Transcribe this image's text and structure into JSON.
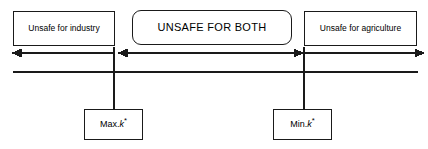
{
  "diagram": {
    "colors": {
      "stroke": "#1a1a1a",
      "background": "#ffffff",
      "text": "#000000"
    },
    "zones": [
      {
        "id": "industry",
        "label": "Unsafe for industry",
        "arrow_direction": "left",
        "shape": "rectangle"
      },
      {
        "id": "both",
        "label": "UNSAFE FOR BOTH",
        "arrow_direction": "both",
        "shape": "rounded-rectangle"
      },
      {
        "id": "agriculture",
        "label": "Unsafe for agriculture",
        "arrow_direction": "right",
        "shape": "rectangle"
      }
    ],
    "markers": [
      {
        "id": "max-k-star",
        "prefix": "Max.",
        "symbol": "k",
        "superscript": "*"
      },
      {
        "id": "min-k-star",
        "prefix": "Min.",
        "symbol": "k",
        "superscript": "*"
      }
    ]
  }
}
